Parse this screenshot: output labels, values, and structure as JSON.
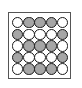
{
  "diagram": {
    "type": "circle-grid",
    "rows": 5,
    "cols": 5,
    "colors": {
      "gray": "#a6a6a6",
      "white": "#ffffff",
      "outline": "#1a1a1a",
      "frame": "#555555"
    },
    "pattern": [
      [
        "white",
        "gray",
        "gray",
        "gray",
        "white"
      ],
      [
        "gray",
        "white",
        "white",
        "white",
        "gray"
      ],
      [
        "white",
        "gray",
        "gray",
        "gray",
        "white"
      ],
      [
        "gray",
        "white",
        "white",
        "white",
        "gray"
      ],
      [
        "white",
        "gray",
        "gray",
        "gray",
        "white"
      ]
    ]
  }
}
